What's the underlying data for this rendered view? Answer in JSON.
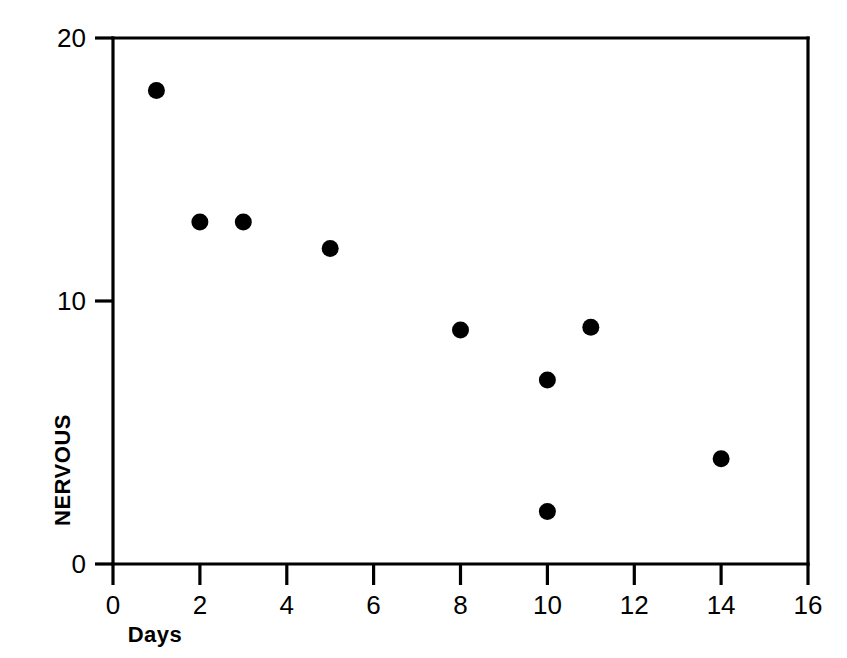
{
  "chart_data": {
    "type": "scatter",
    "title": "",
    "xlabel": "Days",
    "ylabel": "NERVOUS",
    "xlim": [
      0,
      16
    ],
    "ylim": [
      0,
      20
    ],
    "xticks": [
      0,
      2,
      4,
      6,
      8,
      10,
      12,
      14,
      16
    ],
    "xtick_labels": [
      "0",
      "2",
      "4",
      "6",
      "8",
      "10",
      "12",
      "14",
      "16"
    ],
    "yticks": [
      0,
      10,
      20
    ],
    "ytick_labels": [
      "0",
      "10",
      "20"
    ],
    "grid": false,
    "legend": false,
    "marker": "filled-circle",
    "marker_color": "#000000",
    "frame_color": "#000000",
    "background_color": "#ffffff",
    "x": [
      1,
      2,
      3,
      5,
      8,
      10,
      10,
      11,
      14
    ],
    "y": [
      18,
      13,
      13,
      12,
      8.9,
      7,
      2,
      9,
      4
    ],
    "points": [
      {
        "x": 1,
        "y": 18
      },
      {
        "x": 2,
        "y": 13
      },
      {
        "x": 3,
        "y": 13
      },
      {
        "x": 5,
        "y": 12
      },
      {
        "x": 8,
        "y": 8.9
      },
      {
        "x": 10,
        "y": 7
      },
      {
        "x": 10,
        "y": 2
      },
      {
        "x": 11,
        "y": 9
      },
      {
        "x": 14,
        "y": 4
      }
    ]
  },
  "figure": {
    "width": 847,
    "height": 658
  }
}
